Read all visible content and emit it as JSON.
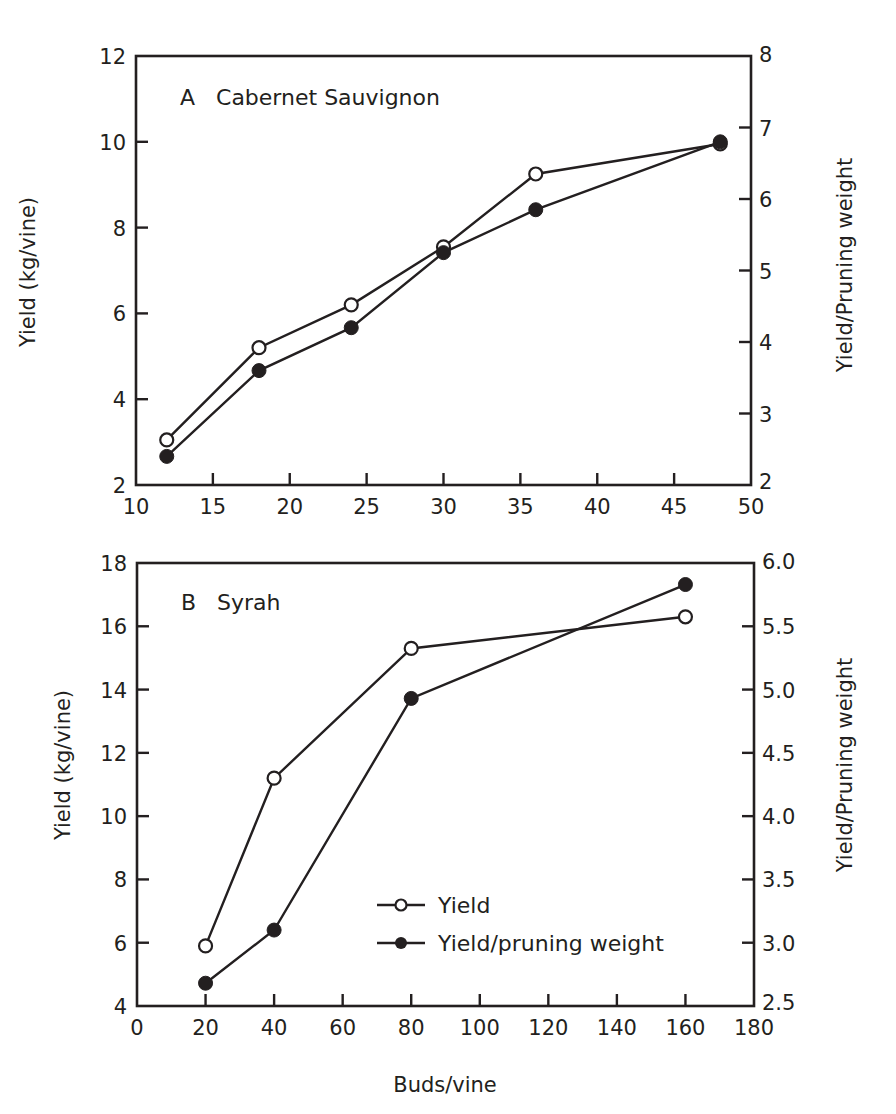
{
  "figure": {
    "shared_xlabel": "Buds/vine",
    "legend": [
      {
        "label": "Yield",
        "marker": "open-circle"
      },
      {
        "label": "Yield/pruning weight",
        "marker": "filled-circle"
      }
    ]
  },
  "chart_data": [
    {
      "type": "line",
      "panel": "A",
      "title": "A   Cabernet Sauvignon",
      "xlabel": "",
      "ylabel": "Yield (kg/vine)",
      "y2label": "Yield/Pruning weight",
      "xlim": [
        10,
        50
      ],
      "ylim": [
        2,
        12
      ],
      "y2lim": [
        2,
        8
      ],
      "xticks": [
        10,
        15,
        20,
        25,
        30,
        35,
        40,
        45,
        50
      ],
      "yticks": [
        2,
        4,
        6,
        8,
        10,
        12
      ],
      "y2ticks": [
        2,
        3,
        4,
        5,
        6,
        7,
        8
      ],
      "grid": false,
      "x": [
        12,
        18,
        24,
        30,
        36,
        48
      ],
      "series": [
        {
          "name": "Yield",
          "axis": "left",
          "marker": "open-circle",
          "values": [
            3.05,
            5.2,
            6.2,
            7.55,
            9.25,
            9.95
          ]
        },
        {
          "name": "Yield/pruning weight",
          "axis": "right",
          "marker": "filled-circle",
          "values": [
            2.4,
            3.6,
            4.2,
            5.25,
            5.85,
            6.8
          ]
        }
      ]
    },
    {
      "type": "line",
      "panel": "B",
      "title": "B   Syrah",
      "xlabel": "Buds/vine",
      "ylabel": "Yield (kg/vine)",
      "y2label": "Yield/Pruning weight",
      "xlim": [
        0,
        180
      ],
      "ylim": [
        4,
        18
      ],
      "y2lim": [
        2.5,
        6.0
      ],
      "xticks": [
        0,
        20,
        40,
        60,
        80,
        100,
        120,
        140,
        160,
        180
      ],
      "yticks": [
        4,
        6,
        8,
        10,
        12,
        14,
        16,
        18
      ],
      "y2ticks": [
        2.5,
        3.0,
        3.5,
        4.0,
        4.5,
        5.0,
        5.5,
        6.0
      ],
      "y2ticklabels": [
        "2.5",
        "3.0",
        "3.5",
        "4.0",
        "4.5",
        "5.0",
        "5.5",
        "6.0"
      ],
      "grid": false,
      "legend_position": "lower center",
      "x": [
        20,
        40,
        80,
        160
      ],
      "series": [
        {
          "name": "Yield",
          "axis": "left",
          "marker": "open-circle",
          "values": [
            5.9,
            11.2,
            15.3,
            16.3
          ]
        },
        {
          "name": "Yield/pruning weight",
          "axis": "right",
          "marker": "filled-circle",
          "values": [
            2.68,
            3.1,
            4.93,
            5.83
          ]
        }
      ]
    }
  ]
}
